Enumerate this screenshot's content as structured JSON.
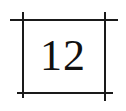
{
  "diagram": {
    "label": "12",
    "line_color": "#1a1a1a",
    "text_color": "#111111"
  }
}
